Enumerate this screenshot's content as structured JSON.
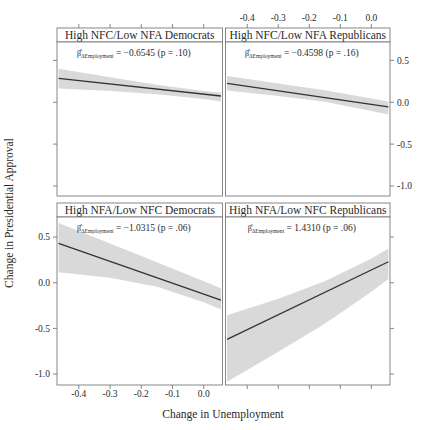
{
  "figure": {
    "axis_titles": {
      "x": "Change in Unemployment",
      "y": "Change in Presidential Approval"
    },
    "x_ticks_bottom": [
      "-0.4",
      "-0.3",
      "-0.2",
      "-0.1",
      "0.0"
    ],
    "x_ticks_top": [
      "-0.4",
      "-0.3",
      "-0.2",
      "-0.1",
      "0.0"
    ],
    "y_ticks_left": [
      "0.5",
      "0.0",
      "-0.5",
      "-1.0"
    ],
    "y_ticks_right": [
      "0.5",
      "0.0",
      "-0.5",
      "-1.0"
    ],
    "colors": {
      "line": "#333333",
      "band": "#d9d9d9",
      "frame": "#7a7a7a",
      "text": "#2a2a2a",
      "background": "#ffffff"
    }
  },
  "chart_data": {
    "type": "line",
    "title": "",
    "xlabel": "Change in Unemployment",
    "ylabel": "Change in Presidential Approval",
    "xlim": [
      -0.47,
      0.06
    ],
    "ylim": [
      -1.12,
      0.72
    ],
    "grid": false,
    "legend": "none",
    "layout": "2x2 trellis",
    "panels": [
      {
        "position": "top-left",
        "strip_label": "High NFC/Low NFA Democrats",
        "annotation": "β̂ ΔEmployment = −0.6545 (p = .10)",
        "coefficient": -0.6545,
        "p_value": 0.1,
        "coef_symbol": "β̂",
        "coef_subscript": "ΔEmployment",
        "coef_text": "= −0.6545 (p = .10)",
        "fit_line": {
          "x": [
            -0.465,
            0.055
          ],
          "y": [
            0.285,
            0.075
          ]
        },
        "ci_band": {
          "x": [
            -0.465,
            -0.3,
            -0.15,
            0.0,
            0.055
          ],
          "upper": [
            0.4,
            0.3,
            0.21,
            0.135,
            0.115
          ],
          "lower": [
            0.165,
            0.135,
            0.095,
            0.04,
            0.01
          ]
        },
        "axes_shown": {
          "left_ticks": true,
          "top_ticks": false,
          "bottom_ticks": false,
          "right_ticks": false
        }
      },
      {
        "position": "top-right",
        "strip_label": "High NFC/Low NFA Republicans",
        "annotation": "β̂ ΔEmployment = −0.4598 (p = .16)",
        "coefficient": -0.4598,
        "p_value": 0.16,
        "coef_symbol": "β̂",
        "coef_subscript": "ΔEmployment",
        "coef_text": "= −0.4598 (p = .16)",
        "fit_line": {
          "x": [
            -0.465,
            0.055
          ],
          "y": [
            0.225,
            -0.055
          ]
        },
        "ci_band": {
          "x": [
            -0.465,
            -0.3,
            -0.15,
            0.0,
            0.055
          ],
          "upper": [
            0.315,
            0.225,
            0.145,
            0.045,
            0.01
          ],
          "lower": [
            0.14,
            0.075,
            0.005,
            -0.105,
            -0.145
          ]
        },
        "axes_shown": {
          "left_ticks": false,
          "top_ticks": true,
          "bottom_ticks": false,
          "right_ticks": true
        }
      },
      {
        "position": "bottom-left",
        "strip_label": "High NFA/Low NFC Democrats",
        "annotation": "β̂ ΔEmployment = −1.0315 (p = .06)",
        "coefficient": -1.0315,
        "p_value": 0.06,
        "coef_symbol": "β̂",
        "coef_subscript": "ΔEmployment",
        "coef_text": "= −1.0315 (p = .06)",
        "fit_line": {
          "x": [
            -0.465,
            0.055
          ],
          "y": [
            0.43,
            -0.19
          ]
        },
        "ci_band": {
          "x": [
            -0.465,
            -0.3,
            -0.15,
            0.0,
            0.055
          ],
          "upper": [
            0.655,
            0.43,
            0.225,
            0.015,
            -0.06
          ],
          "lower": [
            0.115,
            0.055,
            -0.045,
            -0.215,
            -0.29
          ]
        },
        "axes_shown": {
          "left_ticks": true,
          "top_ticks": false,
          "bottom_ticks": true,
          "right_ticks": false
        }
      },
      {
        "position": "bottom-right",
        "strip_label": "High NFA/Low NFC Republicans",
        "annotation": "β̂ ΔEmployment = 1.4310 (p = .06)",
        "coefficient": 1.431,
        "p_value": 0.06,
        "coef_symbol": "β̂",
        "coef_subscript": "ΔEmployment",
        "coef_text": "= 1.4310 (p = .06)",
        "fit_line": {
          "x": [
            -0.465,
            0.055
          ],
          "y": [
            -0.62,
            0.23
          ]
        },
        "ci_band": {
          "x": [
            -0.465,
            -0.3,
            -0.15,
            0.0,
            0.055
          ],
          "upper": [
            -0.355,
            -0.175,
            0.015,
            0.265,
            0.375
          ],
          "lower": [
            -1.085,
            -0.755,
            -0.45,
            -0.1,
            0.04
          ]
        },
        "axes_shown": {
          "left_ticks": false,
          "top_ticks": false,
          "bottom_ticks": true,
          "right_ticks": true
        }
      }
    ]
  }
}
